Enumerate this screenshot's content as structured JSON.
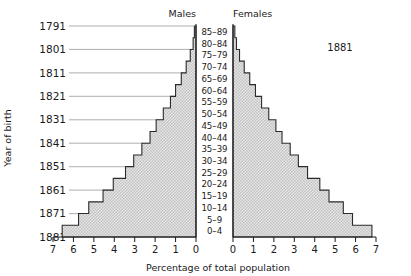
{
  "headers": {
    "males": "Males",
    "females": "Females"
  },
  "annotation": "1881",
  "axes": {
    "x_title": "Percentage of total population",
    "y_title": "Year of birth",
    "x_ticks_left": [
      "7",
      "6",
      "5",
      "4",
      "3",
      "2",
      "1",
      "0"
    ],
    "x_ticks_right": [
      "0",
      "1",
      "2",
      "3",
      "4",
      "5",
      "6",
      "7"
    ],
    "year_labels": [
      "1791",
      "1801",
      "1811",
      "1821",
      "1831",
      "1841",
      "1851",
      "1861",
      "1871",
      "1881"
    ]
  },
  "colors": {
    "fill": "#d9d9d9",
    "outline": "#2b2b2b",
    "axis": "#1a1a1a",
    "leader": "#8c8c8c",
    "text": "#1a1a1a"
  },
  "chart_data": {
    "type": "bar",
    "title": "",
    "subtitle": "1881",
    "orientation": "population-pyramid",
    "xlabel": "Percentage of total population",
    "ylabel": "Year of birth",
    "xlim": [
      0,
      7
    ],
    "grid": false,
    "legend_position": "top",
    "categories": [
      "0–4",
      "5–9",
      "10–14",
      "15–19",
      "20–24",
      "25–29",
      "30–34",
      "35–39",
      "40–44",
      "45–49",
      "50–54",
      "55–59",
      "60–64",
      "65–69",
      "70–74",
      "75–79",
      "80–84",
      "85–89"
    ],
    "year_of_birth": [
      "1881",
      "1876",
      "1871",
      "1866",
      "1861",
      "1856",
      "1851",
      "1846",
      "1841",
      "1836",
      "1831",
      "1826",
      "1821",
      "1816",
      "1811",
      "1806",
      "1801",
      "1796"
    ],
    "series": [
      {
        "name": "Males",
        "values": [
          6.55,
          5.75,
          5.25,
          4.55,
          4.05,
          3.45,
          3.05,
          2.65,
          2.25,
          1.95,
          1.6,
          1.25,
          1.0,
          0.72,
          0.48,
          0.28,
          0.14,
          0.08
        ]
      },
      {
        "name": "Females",
        "values": [
          6.8,
          5.85,
          5.4,
          4.7,
          4.25,
          3.65,
          3.2,
          2.8,
          2.4,
          2.1,
          1.75,
          1.4,
          1.1,
          0.82,
          0.55,
          0.32,
          0.17,
          0.09
        ]
      }
    ]
  }
}
